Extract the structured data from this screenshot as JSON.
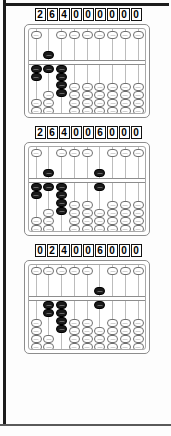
{
  "page": {
    "figure_count": 3
  },
  "colors": {
    "bead_active": "#1a1a1a",
    "bead_inactive": "#ffffff",
    "frame": "#8d8d8d",
    "rod": "#bcbcbc",
    "digit_border": "#111111",
    "page_edge": "#1c1c1c"
  },
  "figures": [
    {
      "name": "abacus-1",
      "number": "264000000",
      "digits": [
        "2",
        "6",
        "4",
        "0",
        "0",
        "0",
        "0",
        "0",
        "0"
      ],
      "rods": [
        {
          "index": 1,
          "digit": 2,
          "heaven": 0,
          "earth": 2
        },
        {
          "index": 2,
          "digit": 6,
          "heaven": 1,
          "earth": 1
        },
        {
          "index": 3,
          "digit": 4,
          "heaven": 0,
          "earth": 4
        },
        {
          "index": 4,
          "digit": 0,
          "heaven": 0,
          "earth": 0
        },
        {
          "index": 5,
          "digit": 0,
          "heaven": 0,
          "earth": 0
        },
        {
          "index": 6,
          "digit": 0,
          "heaven": 0,
          "earth": 0
        },
        {
          "index": 7,
          "digit": 0,
          "heaven": 0,
          "earth": 0
        },
        {
          "index": 8,
          "digit": 0,
          "heaven": 0,
          "earth": 0
        },
        {
          "index": 9,
          "digit": 0,
          "heaven": 0,
          "earth": 0
        }
      ]
    },
    {
      "name": "abacus-2",
      "number": "264006000",
      "digits": [
        "2",
        "6",
        "4",
        "0",
        "0",
        "6",
        "0",
        "0",
        "0"
      ],
      "rods": [
        {
          "index": 1,
          "digit": 2,
          "heaven": 0,
          "earth": 2
        },
        {
          "index": 2,
          "digit": 6,
          "heaven": 1,
          "earth": 1
        },
        {
          "index": 3,
          "digit": 4,
          "heaven": 0,
          "earth": 4
        },
        {
          "index": 4,
          "digit": 0,
          "heaven": 0,
          "earth": 0
        },
        {
          "index": 5,
          "digit": 0,
          "heaven": 0,
          "earth": 0
        },
        {
          "index": 6,
          "digit": 6,
          "heaven": 1,
          "earth": 1
        },
        {
          "index": 7,
          "digit": 0,
          "heaven": 0,
          "earth": 0
        },
        {
          "index": 8,
          "digit": 0,
          "heaven": 0,
          "earth": 0
        },
        {
          "index": 9,
          "digit": 0,
          "heaven": 0,
          "earth": 0
        }
      ]
    },
    {
      "name": "abacus-3",
      "number": "024006000",
      "digits": [
        "0",
        "2",
        "4",
        "0",
        "0",
        "6",
        "0",
        "0",
        "0"
      ],
      "rods": [
        {
          "index": 1,
          "digit": 0,
          "heaven": 0,
          "earth": 0
        },
        {
          "index": 2,
          "digit": 2,
          "heaven": 0,
          "earth": 2
        },
        {
          "index": 3,
          "digit": 4,
          "heaven": 0,
          "earth": 4
        },
        {
          "index": 4,
          "digit": 0,
          "heaven": 0,
          "earth": 0
        },
        {
          "index": 5,
          "digit": 0,
          "heaven": 0,
          "earth": 0
        },
        {
          "index": 6,
          "digit": 6,
          "heaven": 1,
          "earth": 1
        },
        {
          "index": 7,
          "digit": 0,
          "heaven": 0,
          "earth": 0
        },
        {
          "index": 8,
          "digit": 0,
          "heaven": 0,
          "earth": 0
        },
        {
          "index": 9,
          "digit": 0,
          "heaven": 0,
          "earth": 0
        }
      ]
    }
  ]
}
